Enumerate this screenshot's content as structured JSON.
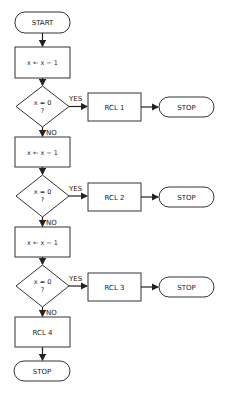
{
  "flowchart": {
    "start": "START",
    "steps": [
      {
        "process": "x ← x − 1",
        "decision": "x = 0",
        "decision_q": "?",
        "yes_label": "YES",
        "no_label": "NO",
        "yes_action": "RCL 1",
        "yes_end": "STOP"
      },
      {
        "process": "x ← x − 1",
        "decision": "x = 0",
        "decision_q": "?",
        "yes_label": "YES",
        "no_label": "NO",
        "yes_action": "RCL 2",
        "yes_end": "STOP"
      },
      {
        "process": "x ← x − 1",
        "decision": "x = 0",
        "decision_q": "?",
        "yes_label": "YES",
        "no_label": "NO",
        "yes_action": "RCL 3",
        "yes_end": "STOP"
      }
    ],
    "final_action": "RCL 4",
    "final_end": "STOP"
  },
  "colors": {
    "stroke": "#333333",
    "background": "#ffffff"
  }
}
